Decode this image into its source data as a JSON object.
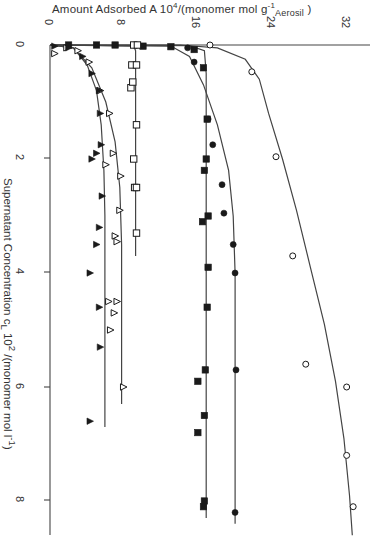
{
  "chart_data": {
    "type": "scatter",
    "title": "",
    "orientation": "rotated 90° (amount axis along top, concentration axis down the left)",
    "xlabel": "Amount Adsorbed A 10^4/(monomer mol g^-1 Aerosil)",
    "ylabel": "Supernatant Concentration c_L 10^2/(monomer mol l^-1)",
    "xlabel_parts": {
      "main": "Amount Adsorbed  A  10",
      "exp": "4",
      "rest": "/(monomer mol g",
      "exp2": "-1",
      "sub": "Aerosil",
      "close": " )"
    },
    "ylabel_text": "Supernatant  Concentration  c",
    "ylabel_sub": "L",
    "ylabel_rest": " 10",
    "ylabel_exp": "2",
    "ylabel_end": " /(monomer mol l",
    "ylabel_exp2": "-1",
    "ylabel_close": ")",
    "x_ticks": [
      "0",
      "8",
      "16",
      "24",
      "32"
    ],
    "y_ticks": [
      "0",
      "2",
      "4",
      "6",
      "8"
    ],
    "xlim": [
      0,
      34
    ],
    "ylim": [
      0,
      8.6
    ],
    "grid": false,
    "legend": "none",
    "series": [
      {
        "name": "open circles",
        "marker": "open-circle",
        "points": [
          [
            17.2,
            0.0
          ],
          [
            21.7,
            0.47
          ],
          [
            24.3,
            1.96
          ],
          [
            26.1,
            3.7
          ],
          [
            27.5,
            5.6
          ],
          [
            31.9,
            6.0
          ],
          [
            31.9,
            7.2
          ],
          [
            32.6,
            8.1
          ]
        ],
        "curve": [
          [
            0,
            0
          ],
          [
            14,
            0
          ],
          [
            18,
            0.05
          ],
          [
            21,
            0.25
          ],
          [
            22.5,
            0.6
          ],
          [
            23.5,
            1.2
          ],
          [
            25,
            2.0
          ],
          [
            26.5,
            2.9
          ],
          [
            28,
            3.9
          ],
          [
            29.5,
            4.9
          ],
          [
            30.7,
            5.9
          ],
          [
            31.6,
            6.9
          ],
          [
            32.2,
            7.9
          ],
          [
            32.5,
            8.6
          ]
        ]
      },
      {
        "name": "filled circles",
        "marker": "filled-circle",
        "points": [
          [
            14.8,
            0.05
          ],
          [
            15.5,
            0.3
          ],
          [
            17.0,
            1.3
          ],
          [
            17.5,
            1.75
          ],
          [
            18.5,
            2.45
          ],
          [
            18.7,
            2.95
          ],
          [
            19.7,
            3.5
          ],
          [
            19.9,
            4.0
          ],
          [
            20.0,
            5.7
          ],
          [
            19.9,
            8.2
          ]
        ],
        "curve": [
          [
            0,
            0
          ],
          [
            13,
            0.02
          ],
          [
            15,
            0.2
          ],
          [
            16.5,
            0.7
          ],
          [
            18,
            1.4
          ],
          [
            19.2,
            2.2
          ],
          [
            19.7,
            3.0
          ],
          [
            19.9,
            4.0
          ],
          [
            19.9,
            6.0
          ],
          [
            19.9,
            8.4
          ]
        ]
      },
      {
        "name": "filled squares",
        "marker": "filled-square",
        "points": [
          [
            2,
            0.0
          ],
          [
            5,
            0.0
          ],
          [
            7,
            0.0
          ],
          [
            10,
            0.02
          ],
          [
            13,
            0.03
          ],
          [
            15.5,
            0.08
          ],
          [
            16.5,
            0.4
          ],
          [
            16.9,
            1.3
          ],
          [
            16.8,
            2.0
          ],
          [
            16.6,
            2.2
          ],
          [
            17.0,
            3.0
          ],
          [
            16.4,
            3.1
          ],
          [
            17.0,
            3.9
          ],
          [
            16.9,
            4.6
          ],
          [
            16.7,
            5.7
          ],
          [
            15.9,
            5.9
          ],
          [
            16.6,
            6.5
          ],
          [
            15.9,
            6.8
          ],
          [
            16.6,
            8.0
          ],
          [
            16.5,
            8.1
          ]
        ],
        "curve": [
          [
            0,
            0
          ],
          [
            15,
            0.01
          ],
          [
            16.6,
            0.1
          ],
          [
            16.8,
            0.5
          ],
          [
            16.8,
            8.3
          ]
        ]
      },
      {
        "name": "open squares",
        "marker": "open-square",
        "points": [
          [
            9.0,
            0.0
          ],
          [
            9.4,
            0.0
          ],
          [
            8.8,
            0.35
          ],
          [
            9.3,
            0.35
          ],
          [
            8.7,
            0.75
          ],
          [
            8.9,
            0.65
          ],
          [
            9.3,
            1.4
          ],
          [
            9.0,
            2.0
          ],
          [
            9.1,
            2.5
          ],
          [
            9.3,
            2.5
          ],
          [
            9.3,
            3.3
          ]
        ],
        "curve": [
          [
            0,
            0
          ],
          [
            9.0,
            0.02
          ],
          [
            9.2,
            0.1
          ],
          [
            9.2,
            3.7
          ]
        ]
      },
      {
        "name": "open triangles",
        "marker": "open-triangle",
        "points": [
          [
            0.5,
            0.15
          ],
          [
            1.8,
            0.05
          ],
          [
            3.0,
            0.1
          ],
          [
            4.2,
            0.3
          ],
          [
            5.4,
            0.8
          ],
          [
            6.4,
            1.2
          ],
          [
            6.8,
            1.9
          ],
          [
            6.0,
            2.1
          ],
          [
            7.6,
            2.3
          ],
          [
            7.5,
            2.9
          ],
          [
            7.0,
            3.35
          ],
          [
            7.2,
            3.45
          ],
          [
            6.3,
            4.5
          ],
          [
            7.2,
            4.5
          ],
          [
            6.9,
            4.7
          ],
          [
            6.5,
            5.0
          ],
          [
            7.9,
            6.0
          ]
        ],
        "curve": [
          [
            0,
            0
          ],
          [
            2.5,
            0.05
          ],
          [
            4.5,
            0.4
          ],
          [
            6.0,
            1.0
          ],
          [
            7.0,
            1.7
          ],
          [
            7.5,
            2.5
          ],
          [
            7.7,
            3.5
          ],
          [
            7.7,
            6.3
          ]
        ]
      },
      {
        "name": "filled triangles",
        "marker": "filled-triangle",
        "points": [
          [
            0.5,
            0.02
          ],
          [
            2.0,
            0.05
          ],
          [
            3.5,
            0.2
          ],
          [
            4.5,
            0.5
          ],
          [
            5.3,
            0.8
          ],
          [
            5.4,
            1.2
          ],
          [
            5.5,
            1.75
          ],
          [
            4.5,
            2.0
          ],
          [
            5.0,
            1.9
          ],
          [
            5.6,
            2.65
          ],
          [
            5.3,
            3.2
          ],
          [
            5.0,
            3.5
          ],
          [
            4.3,
            4.0
          ],
          [
            5.3,
            4.6
          ],
          [
            5.4,
            5.3
          ],
          [
            4.3,
            6.6
          ]
        ],
        "curve": [
          [
            0,
            0
          ],
          [
            2.5,
            0.05
          ],
          [
            4.0,
            0.35
          ],
          [
            5.0,
            0.8
          ],
          [
            5.5,
            1.4
          ],
          [
            5.8,
            2.2
          ],
          [
            5.9,
            3.0
          ],
          [
            5.9,
            6.7
          ]
        ]
      }
    ]
  }
}
